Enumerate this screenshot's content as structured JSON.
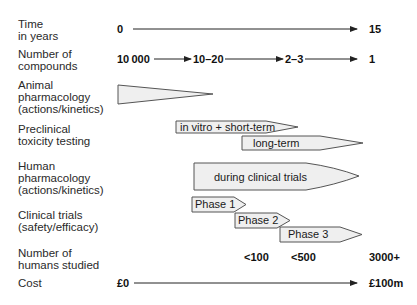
{
  "rows": {
    "time": {
      "lines": [
        "Time",
        "in years"
      ],
      "start": "0",
      "end": "15"
    },
    "compounds": {
      "lines": [
        "Number of",
        "compounds"
      ],
      "values": [
        "10 000",
        "10–20",
        "2–3",
        "1"
      ]
    },
    "animal": {
      "lines": [
        "Animal",
        "pharmacology",
        "(actions/kinetics)"
      ]
    },
    "preclinical": {
      "lines": [
        "Preclinical",
        "toxicity testing"
      ],
      "bars": [
        "in vitro + short-term",
        "long-term"
      ]
    },
    "human": {
      "lines": [
        "Human",
        "pharmacology",
        "(actions/kinetics)"
      ],
      "bar": "during clinical trials"
    },
    "clinical": {
      "lines": [
        "Clinical trials",
        "(safety/efficacy)"
      ],
      "phases": [
        "Phase 1",
        "Phase 2",
        "Phase 3"
      ]
    },
    "humans": {
      "lines": [
        "Number of",
        "humans studied"
      ],
      "values": [
        "<100",
        "<500",
        "3000+"
      ]
    },
    "cost": {
      "lines": [
        "Cost"
      ],
      "start": "£0",
      "end": "£100m"
    }
  },
  "colors": {
    "fill": "#efefef",
    "stroke": "#555555",
    "line": "#222222"
  }
}
